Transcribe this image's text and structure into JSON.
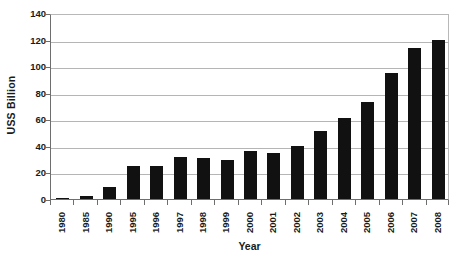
{
  "chart_data": {
    "type": "bar",
    "title": "",
    "subtitle": "",
    "xlabel": "Year",
    "ylabel": "USS Billion",
    "categories": [
      "1980",
      "1985",
      "1990",
      "1995",
      "1996",
      "1997",
      "1998",
      "1999",
      "2000",
      "2001",
      "2002",
      "2003",
      "2004",
      "2005",
      "2006",
      "2007",
      "2008"
    ],
    "values": [
      1,
      2,
      9,
      25,
      25,
      32,
      31,
      29,
      36,
      35,
      40,
      51,
      61,
      73,
      95,
      114,
      120
    ],
    "series": [
      {
        "name": "USS Billion",
        "values": [
          1,
          2,
          9,
          25,
          25,
          32,
          31,
          29,
          36,
          35,
          40,
          51,
          61,
          73,
          95,
          114,
          120
        ]
      }
    ],
    "ylim": [
      0,
      140
    ],
    "yticks": [
      0,
      20,
      40,
      60,
      80,
      100,
      120,
      140
    ],
    "ytick_labels": [
      "0",
      "20",
      "40",
      "60",
      "80",
      "100",
      "120",
      "140"
    ],
    "grid": true,
    "grid_axis": "y",
    "legend": false,
    "legend_position": "none",
    "bar_color": "#111111",
    "gridline_color": "#b5b5b5",
    "axis_color": "#6e6e6e",
    "background": "#ffffff",
    "xtick_rotation": -90
  },
  "axes": {
    "y_title": "USS Billion",
    "x_title": "Year"
  }
}
